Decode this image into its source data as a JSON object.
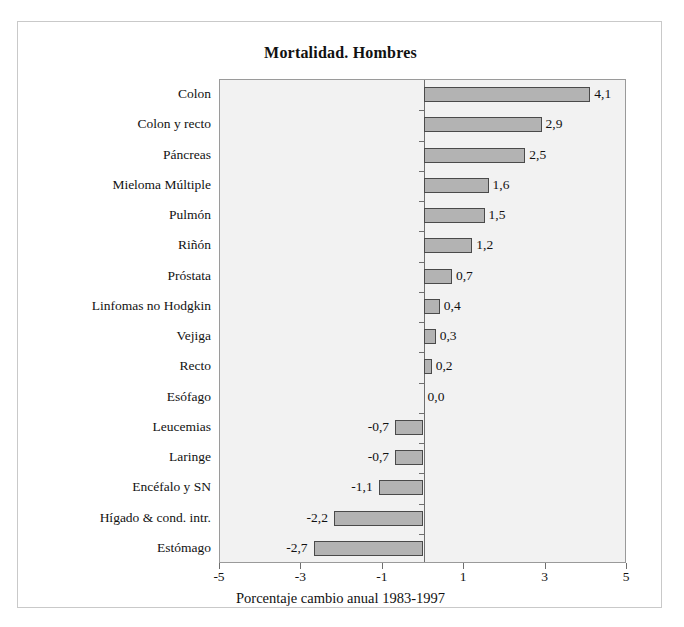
{
  "figure": {
    "title": "Mortalidad. Hombres"
  },
  "chart_data": {
    "type": "bar",
    "orientation": "horizontal",
    "title": "Mortalidad. Hombres",
    "xlabel": "Porcentaje cambio anual 1983-1997",
    "ylabel": "",
    "xlim": [
      -5,
      5
    ],
    "xticks": [
      -5,
      -3,
      -1,
      1,
      3,
      5
    ],
    "xticklabels": [
      "-5",
      "-3",
      "-1",
      "1",
      "3",
      "5"
    ],
    "grid": false,
    "legend": null,
    "categories": [
      "Colon",
      "Colon y recto",
      "Páncreas",
      "Mieloma Múltiple",
      "Pulmón",
      "Riñón",
      "Próstata",
      "Linfomas no Hodgkin",
      "Vejiga",
      "Recto",
      "Esófago",
      "Leucemias",
      "Laringe",
      "Encéfalo y SN",
      "Hígado & cond. intr.",
      "Estómago"
    ],
    "values": [
      4.1,
      2.9,
      2.5,
      1.6,
      1.5,
      1.2,
      0.7,
      0.4,
      0.3,
      0.2,
      0.0,
      -0.7,
      -0.7,
      -1.1,
      -2.2,
      -2.7
    ],
    "value_labels": [
      "4,1",
      "2,9",
      "2,5",
      "1,6",
      "1,5",
      "1,2",
      "0,7",
      "0,4",
      "0,3",
      "0,2",
      "0,0",
      "-0,7",
      "-0,7",
      "-1,1",
      "-2,2",
      "-2,7"
    ],
    "colors": {
      "bar_fill": "#b3b3b3",
      "bar_border": "#4a4a4a",
      "plot_background": "#f2f2f2",
      "axis": "#6e6e6e",
      "text": "#111111"
    }
  }
}
